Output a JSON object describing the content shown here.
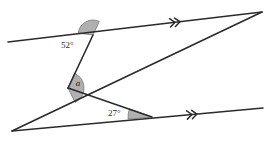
{
  "diagram": {
    "type": "geometry-parallel-lines-transversals",
    "background_color": "#ffffff",
    "stroke_color": "#2b2b2b",
    "arc_fill_color": "#b0b0b0",
    "arc_stroke_color": "#6e6e6e",
    "labels": {
      "angle_top": "52°",
      "angle_middle": "a",
      "angle_bottom": "27°"
    },
    "lines": [
      {
        "name": "top-parallel-line",
        "x1": 8,
        "y1": 42,
        "x2": 262,
        "y2": 12,
        "marker": "double-chevron",
        "marker_count": 2
      },
      {
        "name": "bottom-parallel-line",
        "x1": 12,
        "y1": 131,
        "x2": 263,
        "y2": 108,
        "marker": "double-chevron",
        "marker_count": 2
      },
      {
        "name": "transversal-line",
        "x1": 12,
        "y1": 131,
        "x2": 262,
        "y2": 12,
        "marker": "none",
        "marker_count": 0
      },
      {
        "name": "zigzag-upper-segment",
        "x1": 93,
        "y1": 35,
        "x2": 68,
        "y2": 88,
        "marker": "none",
        "marker_count": 0
      },
      {
        "name": "zigzag-lower-segment",
        "x1": 68,
        "y1": 88,
        "x2": 152,
        "y2": 117,
        "marker": "none",
        "marker_count": 0
      }
    ],
    "vertices": [
      {
        "name": "vertex-52",
        "x": 93,
        "y": 35
      },
      {
        "name": "vertex-a",
        "x": 68,
        "y": 88
      },
      {
        "name": "vertex-27",
        "x": 152,
        "y": 117
      },
      {
        "name": "vertex-top-right",
        "x": 262,
        "y": 12
      },
      {
        "name": "vertex-bottom-left",
        "x": 12,
        "y": 131
      },
      {
        "name": "crossing-point",
        "x": 96,
        "y": 100
      }
    ],
    "angle_arcs": [
      {
        "name": "arc-52",
        "cx": 93,
        "cy": 35,
        "radius": 15,
        "start_deg": 187,
        "end_deg": 295,
        "measure": "52°"
      },
      {
        "name": "arc-a",
        "cx": 68,
        "cy": 88,
        "radius": 16,
        "start_deg": 295,
        "end_deg": 64,
        "measure": "a"
      },
      {
        "name": "arc-27",
        "cx": 152,
        "cy": 117,
        "radius": 24,
        "start_deg": 175,
        "end_deg": 200,
        "measure": "27°"
      }
    ],
    "label_positions": [
      {
        "name": "label-52",
        "x": 61,
        "y": 46,
        "text_anchor": "start"
      },
      {
        "name": "label-a",
        "x": 78,
        "y": 84,
        "text_anchor": "middle"
      },
      {
        "name": "label-27",
        "x": 108,
        "y": 114,
        "text_anchor": "start"
      }
    ],
    "arrow_markers": [
      {
        "name": "arrow-top-line",
        "x": 175,
        "y": 22.3,
        "angle_deg": -6.7
      },
      {
        "name": "arrow-bottom-line",
        "x": 192,
        "y": 114.5,
        "angle_deg": -5.2
      }
    ]
  }
}
